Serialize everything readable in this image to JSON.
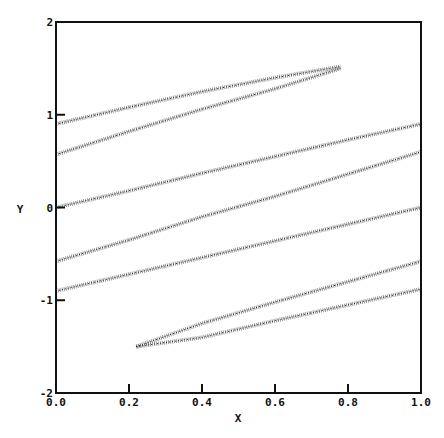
{
  "chart_data": {
    "type": "line",
    "title": "",
    "xlabel": "X",
    "ylabel": "Y",
    "xlim": [
      0.0,
      1.0
    ],
    "ylim": [
      -2,
      2
    ],
    "grid": false,
    "legend": null,
    "x_ticks": [
      "0.0",
      "0.2",
      "0.4",
      "0.6",
      "0.8",
      "1.0"
    ],
    "y_ticks": [
      "-2",
      "-1",
      "0",
      "1",
      "2"
    ],
    "style": "stippled dotted bands, black on white",
    "series": [
      {
        "name": "upper-lobe-top",
        "points": [
          [
            0.0,
            0.9
          ],
          [
            0.2,
            1.08
          ],
          [
            0.4,
            1.25
          ],
          [
            0.6,
            1.4
          ],
          [
            0.78,
            1.52
          ]
        ]
      },
      {
        "name": "upper-lobe-bottom",
        "points": [
          [
            0.0,
            0.57
          ],
          [
            0.2,
            0.82
          ],
          [
            0.4,
            1.06
          ],
          [
            0.6,
            1.28
          ],
          [
            0.78,
            1.5
          ]
        ]
      },
      {
        "name": "band-1",
        "points": [
          [
            0.0,
            0.0
          ],
          [
            0.2,
            0.18
          ],
          [
            0.4,
            0.37
          ],
          [
            0.6,
            0.55
          ],
          [
            0.8,
            0.73
          ],
          [
            1.0,
            0.9
          ]
        ]
      },
      {
        "name": "band-2",
        "points": [
          [
            0.0,
            -0.58
          ],
          [
            0.2,
            -0.35
          ],
          [
            0.4,
            -0.1
          ],
          [
            0.6,
            0.12
          ],
          [
            0.8,
            0.36
          ],
          [
            1.0,
            0.6
          ]
        ]
      },
      {
        "name": "band-3",
        "points": [
          [
            0.0,
            -0.9
          ],
          [
            0.2,
            -0.72
          ],
          [
            0.4,
            -0.54
          ],
          [
            0.6,
            -0.36
          ],
          [
            0.8,
            -0.18
          ],
          [
            1.0,
            0.0
          ]
        ]
      },
      {
        "name": "lower-lobe-top",
        "points": [
          [
            0.22,
            -1.5
          ],
          [
            0.4,
            -1.25
          ],
          [
            0.6,
            -1.02
          ],
          [
            0.8,
            -0.8
          ],
          [
            1.0,
            -0.58
          ]
        ]
      },
      {
        "name": "lower-lobe-bottom",
        "points": [
          [
            0.22,
            -1.5
          ],
          [
            0.4,
            -1.4
          ],
          [
            0.6,
            -1.22
          ],
          [
            0.8,
            -1.05
          ],
          [
            1.0,
            -0.88
          ]
        ]
      }
    ]
  },
  "axes": {
    "x_label": "X",
    "y_label": "Y",
    "x_ticks": [
      "0.0",
      "0.2",
      "0.4",
      "0.6",
      "0.8",
      "1.0"
    ],
    "y_ticks": [
      "2",
      "1",
      "0",
      "-1",
      "-2"
    ]
  }
}
